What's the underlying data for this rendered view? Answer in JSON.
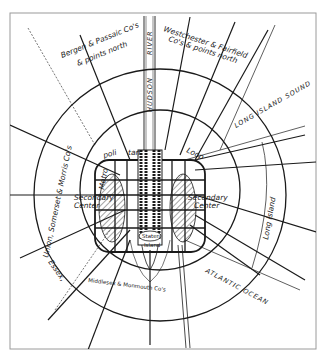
{
  "diagram": {
    "colors": {
      "ink": "#1a1a1a",
      "paper": "#ffffff",
      "frame": "#9a9a9a"
    },
    "labels": {
      "bergen": "Bergen & Passaic Co's",
      "bergen_2": "& points north",
      "westchester": "Westchester & Fairfield",
      "westchester_2": "Co's & points north",
      "hudson_river": "HUDSON",
      "river": "RIVER",
      "long_island_sound": "LONG ISLAND SOUND",
      "metropolitan": "Metro",
      "politan": "poli",
      "tan": "tan",
      "loop": "Loop",
      "secondary_center_left_1": "Secondary",
      "secondary_center_left_2": "Center",
      "secondary_center_right_1": "Secondary",
      "secondary_center_right_2": "Center",
      "union_somerset_morris": "Union, Somerset & Morris Co's",
      "essex": "Essex,",
      "middlesex_monmouth": "Middlesex & Monmouth Co's",
      "long_island": "Long Island",
      "atlantic_ocean": "ATLANTIC OCEAN",
      "staten": "Staten",
      "island": "Island"
    }
  }
}
